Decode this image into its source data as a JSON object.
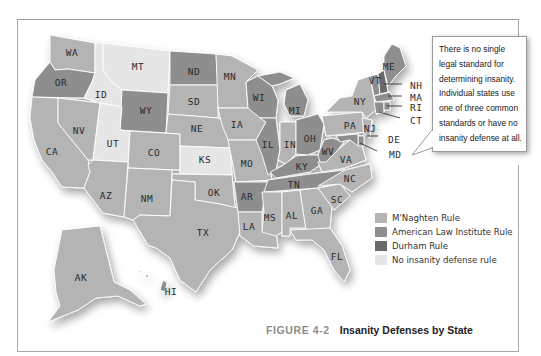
{
  "figure": {
    "number": "FIGURE 4-2",
    "title": "Insanity Defenses by State"
  },
  "callout": {
    "text": "There is no single legal standard for determining insanity. Individual states use one of three common standards or have no insanity defense at all."
  },
  "legend": {
    "items": [
      {
        "key": "mnaghten",
        "label": "M'Naghten Rule",
        "color": "#b4b4b4"
      },
      {
        "key": "ali",
        "label": "American Law Institute Rule",
        "color": "#8e8e8e"
      },
      {
        "key": "durham",
        "label": "Durham Rule",
        "color": "#6a6a6a"
      },
      {
        "key": "none",
        "label": "No insanity defense rule",
        "color": "#e6e6e6"
      }
    ]
  },
  "states": {
    "WA": "mnaghten",
    "OR": "ali",
    "ID": "none",
    "MT": "none",
    "WY": "ali",
    "ND": "ali",
    "MN": "mnaghten",
    "SD": "mnaghten",
    "NE": "mnaghten",
    "IA": "mnaghten",
    "WI": "ali",
    "MI": "ali",
    "NV": "mnaghten",
    "UT": "none",
    "CO": "mnaghten",
    "KS": "none",
    "CA": "mnaghten",
    "AZ": "mnaghten",
    "NM": "mnaghten",
    "OK": "mnaghten",
    "TX": "mnaghten",
    "MO": "mnaghten",
    "AR": "ali",
    "LA": "mnaghten",
    "IL": "ali",
    "IN": "mnaghten",
    "OH": "ali",
    "KY": "ali",
    "TN": "ali",
    "MS": "mnaghten",
    "AL": "mnaghten",
    "GA": "mnaghten",
    "FL": "mnaghten",
    "SC": "mnaghten",
    "NC": "mnaghten",
    "VA": "mnaghten",
    "WV": "ali",
    "PA": "mnaghten",
    "NY": "mnaghten",
    "VT": "ali",
    "NH": "durham",
    "ME": "ali",
    "MA": "ali",
    "RI": "ali",
    "CT": "ali",
    "NJ": "mnaghten",
    "DE": "ali",
    "MD": "ali",
    "AK": "mnaghten",
    "HI": "ali"
  },
  "labels": [
    "WA",
    "OR",
    "ID",
    "MT",
    "WY",
    "ND",
    "MN",
    "SD",
    "NE",
    "IA",
    "WI",
    "MI",
    "NV",
    "UT",
    "CO",
    "KS",
    "CA",
    "AZ",
    "NM",
    "OK",
    "TX",
    "MO",
    "AR",
    "LA",
    "IL",
    "IN",
    "OH",
    "KY",
    "TN",
    "MS",
    "AL",
    "GA",
    "FL",
    "SC",
    "NC",
    "VA",
    "WV",
    "PA",
    "NY",
    "VT",
    "NH",
    "ME",
    "MA",
    "RI",
    "CT",
    "NJ",
    "DE",
    "MD",
    "AK",
    "HI"
  ]
}
